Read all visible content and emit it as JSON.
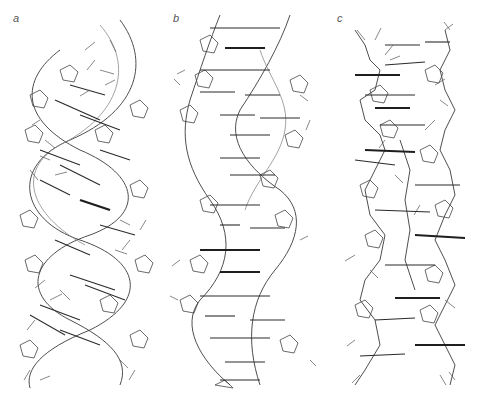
{
  "figure": {
    "caption_fragment": "",
    "panels": [
      {
        "id": "a",
        "label": "a",
        "description": "A-form DNA double helix, stick model, wide and compact with inclined base pairs"
      },
      {
        "id": "b",
        "label": "b",
        "description": "B-form DNA double helix, stick model, base pairs perpendicular to axis"
      },
      {
        "id": "c",
        "label": "c",
        "description": "Z-form DNA double helix, stick model, zig-zag backbone"
      }
    ],
    "colors": {
      "background": "#ffffff",
      "stroke": "#333333",
      "label": "#555555"
    }
  }
}
